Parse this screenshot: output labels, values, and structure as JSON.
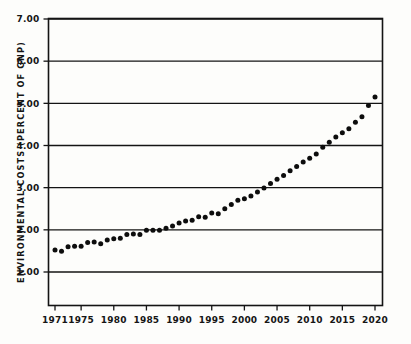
{
  "chart_data": {
    "type": "scatter",
    "title": "",
    "xlabel": "",
    "ylabel": "ENVIRONMENTAL COSTS (PERCENT OF GNP)",
    "xlim": [
      1971,
      2020
    ],
    "ylim": [
      0.4,
      7.0
    ],
    "grid": true,
    "legend": "none",
    "marker": "filled-circle",
    "x_tick_labels": [
      "1971",
      "1975",
      "1980",
      "1985",
      "1990",
      "1995",
      "2000",
      "2005",
      "2010",
      "2015",
      "2020"
    ],
    "x_tick_values": [
      1971,
      1975,
      1980,
      1985,
      1990,
      1995,
      2000,
      2005,
      2010,
      2015,
      2020
    ],
    "y_tick_labels": [
      "1.00",
      "2.00",
      "3.00",
      "4.00",
      "5.00",
      "6.00",
      "7.00"
    ],
    "y_tick_values": [
      1.0,
      2.0,
      3.0,
      4.0,
      5.0,
      6.0,
      7.0
    ],
    "gridline_values": [
      1.0,
      2.0,
      3.0,
      4.0,
      5.0,
      6.0,
      7.0
    ],
    "x": [
      1971,
      1972,
      1973,
      1974,
      1975,
      1976,
      1977,
      1978,
      1979,
      1980,
      1981,
      1982,
      1983,
      1984,
      1985,
      1986,
      1987,
      1988,
      1989,
      1990,
      1991,
      1992,
      1993,
      1994,
      1995,
      1996,
      1997,
      1998,
      1999,
      2000,
      2001,
      2002,
      2003,
      2004,
      2005,
      2006,
      2007,
      2008,
      2009,
      2010,
      2011,
      2012,
      2013,
      2014,
      2015,
      2016,
      2017,
      2018,
      2019,
      2020
    ],
    "values": [
      1.52,
      1.49,
      1.6,
      1.61,
      1.61,
      1.7,
      1.71,
      1.67,
      1.76,
      1.79,
      1.8,
      1.89,
      1.9,
      1.89,
      1.99,
      1.99,
      1.99,
      2.04,
      2.09,
      2.16,
      2.21,
      2.23,
      2.31,
      2.3,
      2.4,
      2.38,
      2.5,
      2.6,
      2.7,
      2.74,
      2.8,
      2.9,
      2.99,
      3.1,
      3.2,
      3.29,
      3.4,
      3.5,
      3.61,
      3.7,
      3.8,
      3.96,
      4.08,
      4.2,
      4.3,
      4.4,
      4.55,
      4.68,
      4.95,
      5.15
    ],
    "series_name": "environmental costs"
  },
  "figure": {
    "background_color": "#fdfdfb",
    "ink_color": "#141414"
  }
}
